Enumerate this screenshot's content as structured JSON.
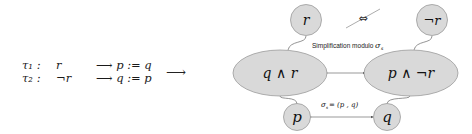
{
  "rules": [
    {
      "name": "τ₁ :",
      "condition": "r",
      "action": "⟶ p := q"
    },
    {
      "name": "τ₂ :",
      "condition": "¬r",
      "action": "⟶ q := p"
    }
  ],
  "transform_arrow": "⟶",
  "diagram": {
    "colors": {
      "node_fill": "#d9d9d9",
      "node_stroke": "#9a9a9a",
      "edge": "#555555"
    },
    "nodes": {
      "top_left": "r",
      "top_right": "¬r",
      "mid_left": "q ∧ r",
      "mid_right": "p ∧ ¬r",
      "bottom_left": "p",
      "bottom_right": "q"
    },
    "equivalence_symbol": "⇔",
    "caption_top": "Simplification modulo",
    "caption_top_sigma": "σ",
    "caption_top_sub": "s",
    "caption_bottom": "σ",
    "caption_bottom_sub": "s",
    "caption_bottom_rest": " = (p , q)"
  }
}
